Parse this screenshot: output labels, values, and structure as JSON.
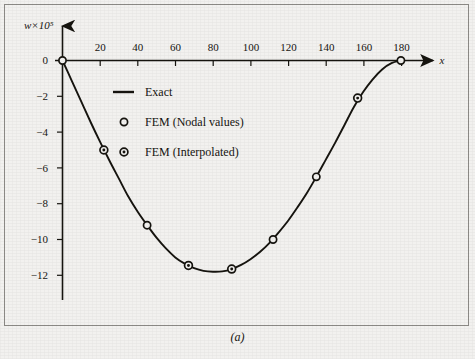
{
  "figure": {
    "caption": "(a)",
    "background_color": "#f2f1ef",
    "ink_color": "#16140f",
    "frame_color": "#8e8c88"
  },
  "chart_data": {
    "type": "line",
    "title": "",
    "subtitle": "",
    "xlabel": "x",
    "ylabel": "w×10⁵",
    "xlim": [
      0,
      195
    ],
    "ylim": [
      -12.8,
      0.6
    ],
    "grid": false,
    "legend_position": "upper-center-left",
    "x_ticks": [
      20,
      40,
      60,
      80,
      100,
      120,
      140,
      160,
      180
    ],
    "x_tick_labels": [
      "20",
      "40",
      "60",
      "80",
      "100",
      "120",
      "140",
      "160",
      "180"
    ],
    "y_ticks": [
      0,
      -2,
      -4,
      -6,
      -8,
      -10,
      -12
    ],
    "y_tick_labels": [
      "0",
      "−2",
      "−4",
      "−6",
      "−8",
      "−10",
      "−12"
    ],
    "origin_label": "0",
    "series": [
      {
        "name": "Exact",
        "marker": "none",
        "style": "solid-line",
        "x": [
          0,
          5,
          10,
          15,
          20,
          25,
          30,
          35,
          40,
          45,
          50,
          55,
          60,
          65,
          70,
          75,
          80,
          85,
          90,
          95,
          100,
          105,
          110,
          115,
          120,
          125,
          130,
          135,
          140,
          145,
          150,
          155,
          160,
          165,
          170,
          175,
          180
        ],
        "y": [
          0,
          -1.15,
          -2.3,
          -3.45,
          -4.55,
          -5.6,
          -6.6,
          -7.6,
          -8.45,
          -9.2,
          -9.9,
          -10.5,
          -11.0,
          -11.35,
          -11.6,
          -11.75,
          -11.8,
          -11.78,
          -11.65,
          -11.42,
          -11.1,
          -10.7,
          -10.2,
          -9.6,
          -8.95,
          -8.2,
          -7.4,
          -6.5,
          -5.55,
          -4.6,
          -3.6,
          -2.6,
          -1.75,
          -1.05,
          -0.5,
          -0.15,
          0
        ]
      },
      {
        "name": "FEM (Nodal values)",
        "marker": "open-circle",
        "style": "markers-only",
        "x": [
          0,
          45,
          112,
          135,
          180
        ],
        "y": [
          0,
          -9.2,
          -10.0,
          -6.5,
          0
        ]
      },
      {
        "name": "FEM (Interpolated)",
        "marker": "dotted-circle",
        "style": "markers-only",
        "x": [
          22,
          67,
          90,
          157
        ],
        "y": [
          -5.0,
          -11.45,
          -11.65,
          -2.1
        ]
      }
    ],
    "legend": [
      {
        "label": "Exact",
        "marker": "line"
      },
      {
        "label": "FEM (Nodal values)",
        "marker": "open-circle"
      },
      {
        "label": "FEM (Interpolated)",
        "marker": "dotted-circle"
      }
    ]
  }
}
